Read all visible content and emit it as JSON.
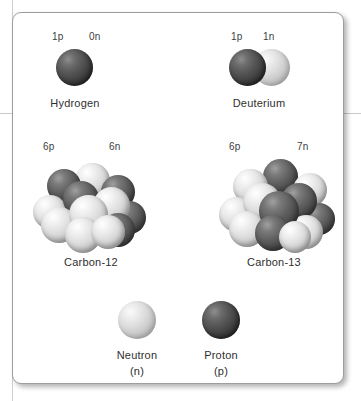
{
  "figure": {
    "background_color": "#ffffff",
    "card_border_color": "#9d9d9d",
    "text_color": "#3d3d3d",
    "proton_color": "#454545",
    "neutron_color": "#dcdcdc"
  },
  "atoms": [
    {
      "id": "hydrogen",
      "name": "Hydrogen",
      "proton_label": "1p",
      "neutron_label": "0n",
      "protons": 1,
      "neutrons": 0
    },
    {
      "id": "deuterium",
      "name": "Deuterium",
      "proton_label": "1p",
      "neutron_label": "1n",
      "protons": 1,
      "neutrons": 1
    },
    {
      "id": "carbon-12",
      "name": "Carbon-12",
      "proton_label": "6p",
      "neutron_label": "6n",
      "protons": 6,
      "neutrons": 6
    },
    {
      "id": "carbon-13",
      "name": "Carbon-13",
      "proton_label": "6p",
      "neutron_label": "7n",
      "protons": 6,
      "neutrons": 7
    }
  ],
  "legend": {
    "neutron": {
      "name": "Neutron",
      "symbol": "(n)"
    },
    "proton": {
      "name": "Proton",
      "symbol": "(p)"
    }
  }
}
